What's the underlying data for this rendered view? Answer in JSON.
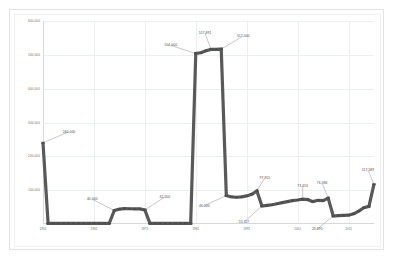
{
  "chart": {
    "background_color": "#ffffff",
    "border_color": "#e3e3e3",
    "line_color": "#595959",
    "marker_color": "#4d4d4d",
    "grid_color": "#eceff1",
    "leader_color": "#b0b0b0"
  },
  "chart_data": {
    "type": "line",
    "title": "",
    "xlabel": "",
    "ylabel": "",
    "grid": true,
    "legend": "none",
    "ylim": [
      0,
      600000
    ],
    "yticks": [
      "600,000",
      "500,000",
      "400,000",
      "300,000",
      "200,000",
      "100,000"
    ],
    "ytick_values": [
      600000,
      500000,
      400000,
      300000,
      200000,
      100000
    ],
    "xticks": [
      "1951",
      "1961",
      "1971",
      "1981",
      "1991",
      "2001",
      "2011"
    ],
    "xtick_values": [
      1951,
      1961,
      1971,
      1981,
      1991,
      2001,
      2011
    ],
    "x": [
      1951,
      1952,
      1953,
      1954,
      1955,
      1956,
      1957,
      1958,
      1959,
      1960,
      1961,
      1962,
      1963,
      1964,
      1965,
      1966,
      1967,
      1968,
      1969,
      1970,
      1971,
      1972,
      1973,
      1974,
      1975,
      1976,
      1977,
      1978,
      1979,
      1980,
      1981,
      1982,
      1983,
      1984,
      1985,
      1986,
      1987,
      1988,
      1989,
      1990,
      1991,
      1992,
      1993,
      1994,
      1995,
      1996,
      1997,
      1998,
      1999,
      2000,
      2001,
      2002,
      2003,
      2004,
      2005,
      2006,
      2007,
      2008,
      2009,
      2010,
      2011,
      2012,
      2013,
      2014,
      2015,
      2016
    ],
    "values": [
      240000,
      2000,
      2000,
      2000,
      2000,
      2000,
      2000,
      2000,
      2000,
      2000,
      2000,
      2000,
      2000,
      2000,
      40000,
      44000,
      45500,
      45000,
      44500,
      44500,
      41500,
      2000,
      2000,
      2000,
      2000,
      2000,
      2000,
      2000,
      2000,
      2000,
      504000,
      506000,
      512000,
      516000,
      516000,
      517000,
      84000,
      80000,
      79000,
      80000,
      83000,
      88000,
      97915,
      53117,
      55000,
      57000,
      60000,
      63000,
      66000,
      69000,
      71000,
      73653,
      72000,
      66000,
      70000,
      69000,
      76384,
      23695,
      25000,
      25500,
      26000,
      30000,
      38000,
      48000,
      52000,
      117589
    ],
    "annotations": [
      {
        "label": "240,000",
        "x": 1951,
        "y": 240000
      },
      {
        "label": "40,000",
        "x": 1965,
        "y": 40000
      },
      {
        "label": "41,500",
        "x": 1971,
        "y": 41500
      },
      {
        "label": "504,000",
        "x": 1981,
        "y": 504000
      },
      {
        "label": "517,891",
        "x": 1984,
        "y": 516000
      },
      {
        "label": "517,000",
        "x": 1986,
        "y": 517000
      },
      {
        "label": "46,000",
        "x": 1987,
        "y": 84000
      },
      {
        "label": "97,915",
        "x": 1993,
        "y": 97915
      },
      {
        "label": "53,117",
        "x": 1994,
        "y": 53117
      },
      {
        "label": "73,653",
        "x": 2002,
        "y": 73653
      },
      {
        "label": "76,384",
        "x": 2007,
        "y": 76384
      },
      {
        "label": "23,695",
        "x": 2008,
        "y": 23695
      },
      {
        "label": "117,589",
        "x": 2016,
        "y": 117589
      }
    ]
  }
}
